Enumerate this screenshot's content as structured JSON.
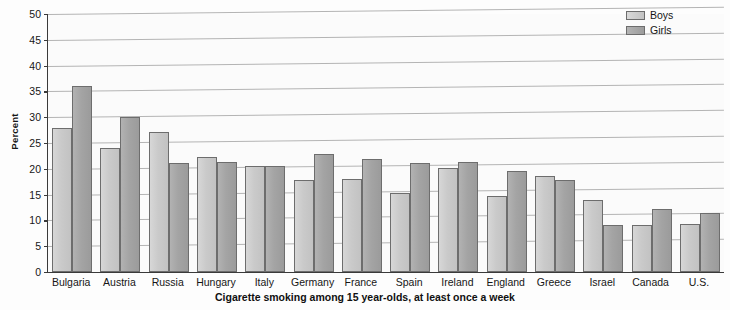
{
  "chart_data": {
    "type": "bar",
    "title": "",
    "xlabel": "Cigarette smoking among 15 year-olds, at least once a week",
    "ylabel": "Percent",
    "ylim": [
      0,
      50
    ],
    "ytick_step": 5,
    "yticks": [
      0,
      5,
      10,
      15,
      20,
      25,
      30,
      35,
      40,
      45,
      50
    ],
    "grid": true,
    "legend_position": "top-right",
    "categories": [
      "Bulgaria",
      "Austria",
      "Russia",
      "Hungary",
      "Italy",
      "Germany",
      "France",
      "Spain",
      "Ireland",
      "England",
      "Greece",
      "Israel",
      "Canada",
      "U.S."
    ],
    "series": [
      {
        "name": "Boys",
        "color": "#c8c8c8",
        "values": [
          28.0,
          24.0,
          27.1,
          22.3,
          20.5,
          17.9,
          18.0,
          15.4,
          20.2,
          14.8,
          18.7,
          14.0,
          9.2,
          9.3
        ]
      },
      {
        "name": "Girls",
        "color": "#a3a3a3",
        "values": [
          36.0,
          30.1,
          21.2,
          21.4,
          20.5,
          22.8,
          21.9,
          21.1,
          21.3,
          19.5,
          17.8,
          9.1,
          12.2,
          11.4
        ]
      }
    ]
  },
  "legend": {
    "items": [
      {
        "label": "Boys",
        "key": "boys"
      },
      {
        "label": "Girls",
        "key": "girls"
      }
    ]
  }
}
